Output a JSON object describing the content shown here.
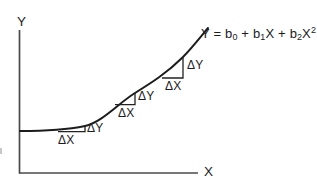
{
  "figure": {
    "background": "#ffffff",
    "curve_color": "#1c1c1c",
    "axis_color": "#4a4a4a"
  },
  "axes": {
    "y_label": "Y",
    "x_label": "X"
  },
  "equation": {
    "part1": "Y = b",
    "sub1": "0",
    "part2": " + b",
    "sub2": "1",
    "part3": "X + b",
    "sub3": "2",
    "part4": "X",
    "sup4": "2"
  },
  "triangles": [
    {
      "dx_label": "ΔX",
      "dy_label": "ΔY"
    },
    {
      "dx_label": "ΔX",
      "dy_label": "ΔY"
    },
    {
      "dx_label": "ΔX",
      "dy_label": "ΔY"
    }
  ]
}
